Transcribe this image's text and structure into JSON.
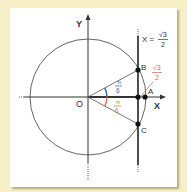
{
  "diagram": {
    "axes": {
      "x_label": "X",
      "y_label": "Y",
      "origin_label": "O"
    },
    "points": [
      {
        "label": "A",
        "x": 145,
        "y": 97
      },
      {
        "label": "B",
        "x": 138,
        "y": 70
      },
      {
        "label": "C",
        "x": 138,
        "y": 124
      },
      {
        "label": "",
        "x": 138,
        "y": 97
      }
    ],
    "line_label": {
      "lhs": "X =",
      "num": "√3",
      "den": "2"
    },
    "length_label": {
      "num": "√3",
      "den": "2"
    },
    "angle_upper": {
      "num": "π",
      "den": "6"
    },
    "angle_lower": {
      "num": "π",
      "den": "6"
    },
    "colors": {
      "background": "#f7f0c6",
      "panel": "#ffffff",
      "ink": "#333333",
      "angle_upper": "#2f6db5",
      "angle_lower": "#d2704a",
      "length_label": "#d2704a"
    }
  }
}
